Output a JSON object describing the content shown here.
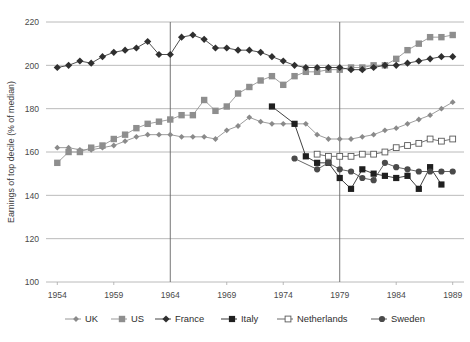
{
  "chart_data": {
    "type": "line",
    "title": "",
    "subtitle": "",
    "xlabel": "",
    "ylabel": "Earnings of top decile (% of median)",
    "xlim": [
      1953,
      1990
    ],
    "ylim": [
      100,
      220
    ],
    "ytick_labels": [
      "100",
      "120",
      "140",
      "160",
      "180",
      "200",
      "220"
    ],
    "ytick_values": [
      100,
      120,
      140,
      160,
      180,
      200,
      220
    ],
    "xtick_labels": [
      "1954",
      "1959",
      "1964",
      "1969",
      "1974",
      "1979",
      "1984",
      "1989"
    ],
    "xtick_values": [
      1954,
      1959,
      1964,
      1969,
      1974,
      1979,
      1984,
      1989
    ],
    "grid": "horizontal",
    "vertical_reference_lines": [
      1964,
      1979
    ],
    "legend_position": "bottom",
    "marker_shapes": {
      "UK": "small-diamond",
      "US": "filled-square",
      "France": "filled-diamond",
      "Italy": "filled-square-dark",
      "Netherlands": "open-square",
      "Sweden": "filled-circle"
    },
    "colors": {
      "UK": "#8a8a8a",
      "US": "#8e8e8e",
      "France": "#2f2f2f",
      "Italy": "#1f1f1f",
      "Netherlands": "#ffffff",
      "Netherlands_stroke": "#5a5a5a",
      "Sweden": "#4a4a4a",
      "grid": "#a8a8a8",
      "vline": "#666666",
      "text": "#3b3b3b",
      "background": "#ffffff"
    },
    "series": [
      {
        "name": "UK",
        "marker": "small-diamond",
        "color": "#8a8a8a",
        "x": [
          1954,
          1955,
          1956,
          1957,
          1958,
          1959,
          1960,
          1961,
          1962,
          1963,
          1964,
          1965,
          1966,
          1967,
          1968,
          1969,
          1970,
          1971,
          1972,
          1973,
          1974,
          1975,
          1976,
          1977,
          1978,
          1979,
          1980,
          1981,
          1982,
          1983,
          1984,
          1985,
          1986,
          1987,
          1988,
          1989
        ],
        "y": [
          162,
          162,
          161,
          161,
          162,
          163,
          165,
          167,
          168,
          168,
          168,
          167,
          167,
          167,
          166,
          170,
          172,
          176,
          174,
          173,
          173,
          173,
          173,
          168,
          166,
          166,
          166,
          167,
          168,
          170,
          171,
          173,
          175,
          177,
          180,
          183
        ]
      },
      {
        "name": "US",
        "marker": "filled-square",
        "color": "#8e8e8e",
        "x": [
          1954,
          1955,
          1956,
          1957,
          1958,
          1959,
          1960,
          1961,
          1962,
          1963,
          1964,
          1965,
          1966,
          1967,
          1968,
          1969,
          1970,
          1971,
          1972,
          1973,
          1974,
          1975,
          1976,
          1977,
          1978,
          1979,
          1980,
          1981,
          1982,
          1983,
          1984,
          1985,
          1986,
          1987,
          1988,
          1989
        ],
        "y": [
          155,
          160,
          160,
          162,
          163,
          166,
          168,
          171,
          173,
          174,
          175,
          177,
          177,
          184,
          179,
          181,
          187,
          190,
          193,
          195,
          191,
          195,
          197,
          197,
          198,
          198,
          199,
          199,
          200,
          200,
          203,
          207,
          210,
          213,
          213,
          214
        ]
      },
      {
        "name": "France",
        "marker": "filled-diamond",
        "color": "#2f2f2f",
        "x": [
          1954,
          1955,
          1956,
          1957,
          1958,
          1959,
          1960,
          1961,
          1962,
          1963,
          1964,
          1965,
          1966,
          1967,
          1968,
          1969,
          1970,
          1971,
          1972,
          1973,
          1974,
          1975,
          1976,
          1977,
          1978,
          1979,
          1980,
          1981,
          1982,
          1983,
          1984,
          1985,
          1986,
          1987,
          1988,
          1989
        ],
        "y": [
          199,
          200,
          202,
          201,
          204,
          206,
          207,
          208,
          211,
          205,
          205,
          213,
          214,
          212,
          208,
          208,
          207,
          207,
          206,
          204,
          202,
          200,
          199,
          199,
          199,
          199,
          198,
          198,
          199,
          200,
          200,
          201,
          202,
          203,
          204,
          204
        ]
      },
      {
        "name": "Italy",
        "marker": "filled-square-dark",
        "color": "#1f1f1f",
        "x": [
          1973,
          1975,
          1976,
          1977,
          1978,
          1979,
          1980,
          1981,
          1982,
          1983,
          1984,
          1985,
          1986,
          1987,
          1988
        ],
        "y": [
          181,
          173,
          158,
          155,
          155,
          148,
          143,
          152,
          150,
          149,
          148,
          149,
          143,
          153,
          145
        ]
      },
      {
        "name": "Netherlands",
        "marker": "open-square",
        "color": "#ffffff",
        "stroke": "#5a5a5a",
        "x": [
          1977,
          1978,
          1979,
          1980,
          1981,
          1982,
          1983,
          1984,
          1985,
          1986,
          1987,
          1988,
          1989
        ],
        "y": [
          159,
          158,
          158,
          158,
          159,
          159,
          160,
          162,
          163,
          164,
          166,
          165,
          166
        ]
      },
      {
        "name": "Sweden",
        "marker": "filled-circle",
        "color": "#4a4a4a",
        "x": [
          1975,
          1977,
          1978,
          1979,
          1980,
          1981,
          1982,
          1983,
          1984,
          1985,
          1986,
          1987,
          1988,
          1989
        ],
        "y": [
          157,
          152,
          155,
          152,
          151,
          148,
          147,
          155,
          153,
          152,
          151,
          151,
          151,
          151
        ]
      }
    ]
  },
  "legend": {
    "entries": [
      {
        "label": "UK",
        "marker": "small-diamond"
      },
      {
        "label": "US",
        "marker": "filled-square"
      },
      {
        "label": "France",
        "marker": "filled-diamond"
      },
      {
        "label": "Italy",
        "marker": "filled-square-dark"
      },
      {
        "label": "Netherlands",
        "marker": "open-square"
      },
      {
        "label": "Sweden",
        "marker": "filled-circle"
      }
    ]
  }
}
